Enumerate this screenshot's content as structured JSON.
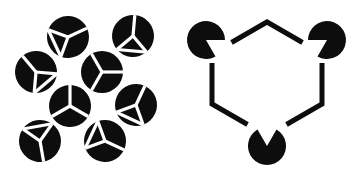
{
  "figure": {
    "background_color": "#ffffff",
    "ink_color": "#0d0d0d",
    "canvas": {
      "width": 356,
      "height": 174
    }
  },
  "panels": [
    {
      "id": "left-panel",
      "label": "Cube-corner disk cluster",
      "description": "Eight solid black disks, each incised with thin white lines forming Y-junctions or corner junctions, suggesting occluded cube corners",
      "disk_radius": 21,
      "line_color": "#ffffff",
      "line_width": 3.2,
      "disks": [
        {
          "name": "disk-top-left",
          "cx": 68,
          "cy": 37,
          "type": "corner",
          "rotation": 200
        },
        {
          "name": "disk-top-right",
          "cx": 133,
          "cy": 36,
          "type": "corner",
          "rotation": 140
        },
        {
          "name": "disk-upper-left",
          "cx": 36,
          "cy": 72,
          "type": "corner",
          "rotation": 95
        },
        {
          "name": "disk-center",
          "cx": 102,
          "cy": 72,
          "type": "y",
          "rotation": 0
        },
        {
          "name": "disk-middle-left",
          "cx": 70,
          "cy": 106,
          "type": "y",
          "rotation": 30
        },
        {
          "name": "disk-middle-right",
          "cx": 136,
          "cy": 105,
          "type": "corner",
          "rotation": 160
        },
        {
          "name": "disk-bottom-left",
          "cx": 40,
          "cy": 141,
          "type": "corner",
          "rotation": 305
        },
        {
          "name": "disk-bottom-right",
          "cx": 105,
          "cy": 141,
          "type": "corner",
          "rotation": 250
        }
      ]
    },
    {
      "id": "right-panel",
      "label": "Kanizsa triangle",
      "description": "Three pacman inducer disks with wedge mouths aimed at a common centre, plus three open angle (chevron) outlines, producing an illusory upright triangle",
      "pacman_radius": 19,
      "wedge_angle_degrees": 60,
      "inducers": [
        {
          "name": "pacman-top-left",
          "cx": 206,
          "cy": 40,
          "mouth_direction_degrees": 30
        },
        {
          "name": "pacman-top-right",
          "cx": 327,
          "cy": 40,
          "mouth_direction_degrees": 150
        },
        {
          "name": "pacman-bottom",
          "cx": 267,
          "cy": 146,
          "mouth_direction_degrees": 270
        }
      ],
      "angles": [
        {
          "name": "chevron-top",
          "apex_x": 267,
          "apex_y": 22,
          "rotation": 0
        },
        {
          "name": "chevron-bottom-left",
          "apex_x": 212,
          "apex_y": 104,
          "rotation": 240
        },
        {
          "name": "chevron-bottom-right",
          "apex_x": 322,
          "apex_y": 104,
          "rotation": 120
        }
      ],
      "angle_arm_length": 41,
      "angle_spread_degrees": 60,
      "angle_stroke_width": 5
    }
  ]
}
